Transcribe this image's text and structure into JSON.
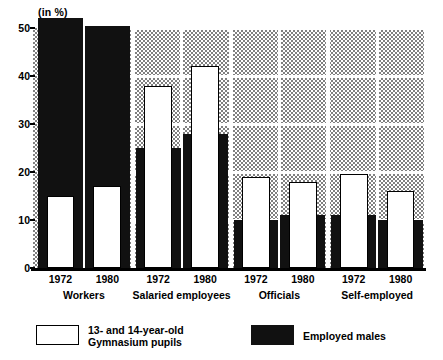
{
  "chart_data": {
    "type": "bar",
    "title": "",
    "subtitle": "",
    "unit_label": "(in %)",
    "xlabel": "",
    "ylabel": "",
    "ylim": [
      0,
      50
    ],
    "yticks": [
      0,
      10,
      20,
      30,
      40,
      50
    ],
    "ytick_labels": [
      "0",
      "10",
      "20",
      "30",
      "40",
      "50"
    ],
    "grid": true,
    "legend_position": "bottom",
    "categories": [
      "Workers 1972",
      "Workers 1980",
      "Salaried employees 1972",
      "Salaried employees 1980",
      "Officials 1972",
      "Officials 1980",
      "Self-employed 1972",
      "Self-employed 1980"
    ],
    "groups": [
      {
        "name": "Workers",
        "years": [
          "1972",
          "1980"
        ],
        "pupils": [
          15,
          17
        ],
        "males": [
          52,
          50.5
        ]
      },
      {
        "name": "Salaried\nemployees",
        "years": [
          "1972",
          "1980"
        ],
        "pupils": [
          38,
          42
        ],
        "males": [
          25,
          28
        ]
      },
      {
        "name": "Officials",
        "years": [
          "1972",
          "1980"
        ],
        "pupils": [
          19,
          18
        ],
        "males": [
          10,
          11
        ]
      },
      {
        "name": "Self-employed",
        "years": [
          "1972",
          "1980"
        ],
        "pupils": [
          19.5,
          16
        ],
        "males": [
          11,
          10
        ]
      }
    ],
    "series": [
      {
        "name": "13- and 14-year-old Gymnasium pupils",
        "color": "#ffffff",
        "values": [
          15,
          17,
          38,
          42,
          19,
          18,
          19.5,
          16
        ]
      },
      {
        "name": "Employed males",
        "color": "#111111",
        "values": [
          52,
          50.5,
          25,
          28,
          10,
          11,
          11,
          10
        ]
      }
    ]
  },
  "legend": {
    "pupils_label": "13- and 14-year-old\nGymnasium pupils",
    "males_label": "Employed males"
  },
  "colors": {
    "bar_black": "#111111",
    "bar_white": "#ffffff",
    "plot_background": "#808080",
    "gridline": "#ffffff",
    "axis": "#000000"
  }
}
